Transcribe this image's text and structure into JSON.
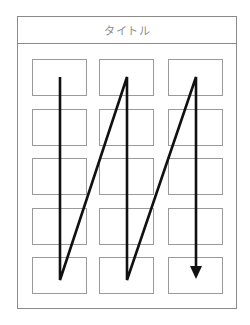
{
  "header": {
    "title": "タイトル"
  },
  "grid": {
    "columns": 3,
    "rows": 5,
    "column_x": [
      32,
      99,
      168
    ],
    "row_y": [
      59,
      109,
      158,
      208,
      257
    ]
  },
  "flow": {
    "description": "Z-order reading direction: down column 1, diagonal up to top of column 2, down column 2, diagonal up to top of column 3, down column 3 ending in arrowhead",
    "points": [
      [
        60,
        77
      ],
      [
        60,
        280
      ],
      [
        127,
        77
      ],
      [
        127,
        280
      ],
      [
        196,
        77
      ],
      [
        196,
        268
      ]
    ],
    "arrowhead": [
      [
        190,
        266
      ],
      [
        202,
        266
      ],
      [
        196,
        279
      ]
    ],
    "stroke_color": "#111111"
  },
  "colors": {
    "border": "#8a8a8a",
    "cell_border": "#9a9a9a",
    "title_text": "#8c8c8c",
    "line": "#111111"
  }
}
